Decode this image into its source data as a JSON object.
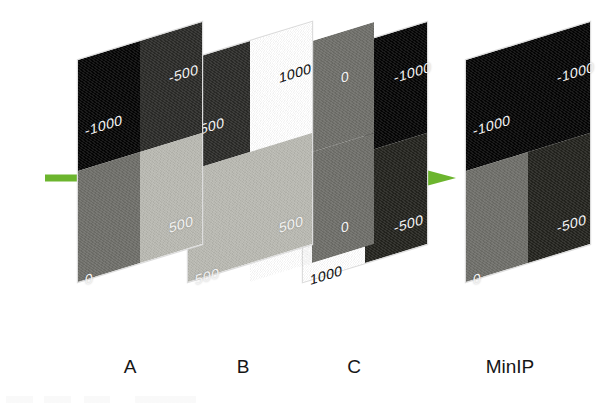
{
  "figure": {
    "background_color": "#ffffff",
    "arrow": {
      "name": "projection-direction-arrow",
      "color": "#6cb52e",
      "direction": "left-to-right",
      "x_start": 45,
      "x_end": 456,
      "y": 178,
      "shaft_thickness": 7,
      "head_width": 56,
      "head_height": 30
    },
    "grayscale_ramp": [
      {
        "value": "-1000",
        "color": "#050505"
      },
      {
        "value": "-500",
        "color": "#2b2b28"
      },
      {
        "value": "0",
        "color": "#6e6e69"
      },
      {
        "value": "500",
        "color": "#b9b9b2"
      },
      {
        "value": "1000",
        "color": "#ffffff"
      }
    ],
    "panels": [
      {
        "id": "panel-a",
        "caption": "A",
        "caption_x": 130,
        "left": 78,
        "top": 60,
        "width": 124,
        "height": 222,
        "z": 4,
        "quadrants": [
          {
            "pos": "tl",
            "value": "-1000",
            "color": "#050505",
            "label_color": "light"
          },
          {
            "pos": "tr",
            "value": "-500",
            "color": "#2b2b28",
            "label_color": "light"
          },
          {
            "pos": "bl",
            "value": "0",
            "color": "#6e6e69",
            "label_color": "light"
          },
          {
            "pos": "br",
            "value": "500",
            "color": "#b9b9b2",
            "label_color": "light"
          }
        ]
      },
      {
        "id": "panel-b",
        "caption": "B",
        "caption_x": 243,
        "left": 188,
        "top": 60,
        "width": 124,
        "height": 222,
        "z": 3,
        "quadrants": [
          {
            "pos": "tl",
            "value": "-500",
            "color": "#2b2b28",
            "label_color": "light"
          },
          {
            "pos": "tr",
            "value": "1000",
            "color": "#ffffff",
            "label_color": "dark"
          },
          {
            "pos": "bl",
            "value": "500",
            "color": "#b9b9b2",
            "label_color": "light"
          },
          {
            "pos": "br",
            "value": "500",
            "color": "#b9b9b2",
            "label_color": "light"
          }
        ]
      },
      {
        "id": "panel-b-right-column",
        "caption": "",
        "caption_x": 0,
        "left": 250,
        "top": 60,
        "width": 124,
        "height": 222,
        "z": 2,
        "quadrants": [
          {
            "pos": "tl",
            "value": "",
            "color": "transparent",
            "label_color": "light"
          },
          {
            "pos": "tr",
            "value": "0",
            "color": "#6e6e69",
            "label_color": "light"
          },
          {
            "pos": "bl",
            "value": "",
            "color": "transparent",
            "label_color": "light"
          },
          {
            "pos": "br",
            "value": "0",
            "color": "#6e6e69",
            "label_color": "light"
          }
        ]
      },
      {
        "id": "panel-c",
        "caption": "C",
        "caption_x": 354,
        "left": 303,
        "top": 60,
        "width": 124,
        "height": 222,
        "z": 1,
        "quadrants": [
          {
            "pos": "tl",
            "value": "1000",
            "color": "#ffffff",
            "label_color": "dark"
          },
          {
            "pos": "tr",
            "value": "-1000",
            "color": "#050505",
            "label_color": "light"
          },
          {
            "pos": "bl",
            "value": "1000",
            "color": "#ffffff",
            "label_color": "dark"
          },
          {
            "pos": "br",
            "value": "-500",
            "color": "#24241f",
            "label_color": "light"
          }
        ]
      },
      {
        "id": "panel-minip",
        "caption": "MinIP",
        "caption_x": 510,
        "left": 466,
        "top": 60,
        "width": 124,
        "height": 222,
        "z": 5,
        "quadrants": [
          {
            "pos": "tl",
            "value": "-1000",
            "color": "#050505",
            "label_color": "light"
          },
          {
            "pos": "tr",
            "value": "-1000",
            "color": "#050505",
            "label_color": "light"
          },
          {
            "pos": "bl",
            "value": "0",
            "color": "#6e6e69",
            "label_color": "light"
          },
          {
            "pos": "br",
            "value": "-500",
            "color": "#24241f",
            "label_color": "light"
          }
        ]
      }
    ],
    "captions": {
      "y": 356,
      "items": [
        {
          "name": "caption-a",
          "text": "A",
          "x": 130
        },
        {
          "name": "caption-b",
          "text": "B",
          "x": 243
        },
        {
          "name": "caption-c",
          "text": "C",
          "x": 354
        },
        {
          "name": "caption-minip",
          "text": "MinIP",
          "x": 510
        }
      ]
    }
  }
}
